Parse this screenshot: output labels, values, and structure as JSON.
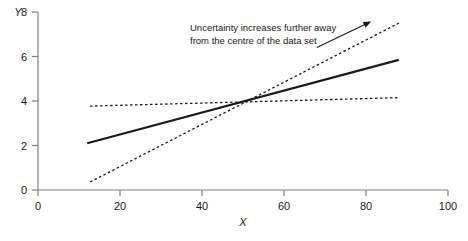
{
  "chart_data": {
    "type": "line",
    "title": "",
    "xlabel": "X",
    "ylabel": "Y",
    "xlim": [
      0,
      100
    ],
    "ylim": [
      0,
      8
    ],
    "xticks": [
      0,
      20,
      40,
      60,
      80,
      100
    ],
    "yticks": [
      0,
      2,
      4,
      6,
      8
    ],
    "grid": false,
    "legend": "none",
    "series": [
      {
        "name": "regression-line",
        "style": "solid",
        "color": "#1a1a1a",
        "x": [
          12,
          88
        ],
        "y": [
          2.1,
          5.85
        ]
      },
      {
        "name": "upper-confidence-limit",
        "style": "dotted",
        "color": "#1a1a1a",
        "x": [
          12.7,
          88
        ],
        "y": [
          3.77,
          4.15
        ]
      },
      {
        "name": "lower-confidence-limit",
        "style": "dotted",
        "color": "#1a1a1a",
        "x": [
          12.7,
          88
        ],
        "y": [
          0.36,
          7.5
        ]
      }
    ],
    "annotations": [
      {
        "name": "uncertainty-note",
        "line1": "Uncertainty increases further away",
        "line2": "from the centre of the data set",
        "arrow": {
          "from_x": 68,
          "from_y": 6.4,
          "to_x": 81,
          "to_y": 7.55
        }
      }
    ]
  },
  "axis": {
    "y_title": "Y",
    "x_title": "X",
    "x_tick_labels": [
      "0",
      "20",
      "40",
      "60",
      "80",
      "100"
    ],
    "y_tick_labels": [
      "0",
      "2",
      "4",
      "6",
      "8"
    ]
  },
  "colors": {
    "axis": "#808080",
    "ink": "#1a1a1a",
    "background": "#ffffff"
  }
}
